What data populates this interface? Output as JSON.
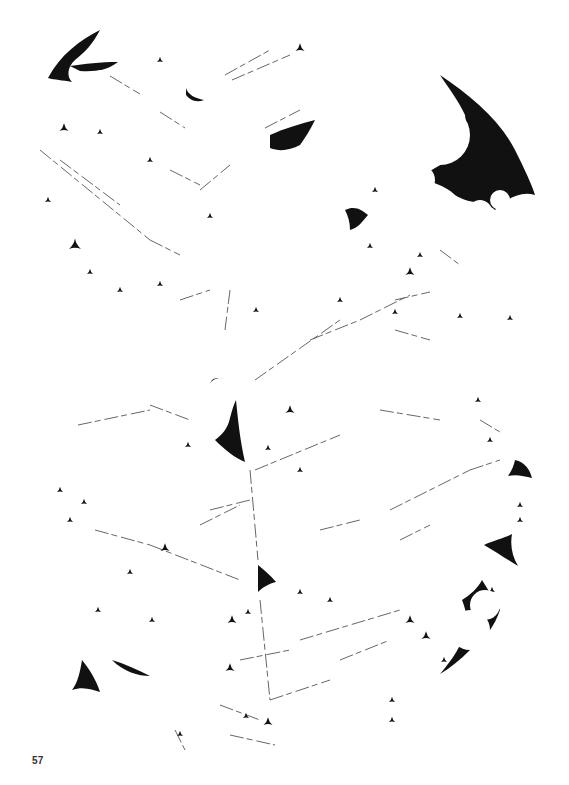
{
  "page": {
    "page_number": "57",
    "background": "#ffffff",
    "ink": "#111111",
    "line_color": "#555555"
  },
  "artwork": {
    "description": "Abstract fractal illustration of black cusp-shaped fragments (Apollonian-gasket-like gaps between white circles) and thin broken lines on a white page",
    "large_shapes": [
      "M48,78 C60,55 80,40 100,30 C92,45 85,52 75,60 C68,66 66,76 72,82 C62,80 55,80 48,78 Z",
      "M70,66 C85,64 100,62 118,62 C108,70 95,72 80,71 Z",
      "M440,75 C470,95 500,120 515,150 C525,170 532,185 535,195 C520,190 505,200 495,210 C485,200 470,205 455,195 C445,185 430,182 420,178 C430,170 440,165 450,160 C462,150 468,135 465,115 C458,100 450,90 440,75 Z",
      "M212,380 C220,375 228,380 230,390 C222,392 218,398 212,395 C210,390 208,385 212,380 Z",
      "M236,400 C238,420 240,440 245,462 C235,458 225,450 215,440 C222,435 228,428 230,418 C232,410 234,404 236,400 Z",
      "M462,600 C470,595 478,588 482,580 C488,590 495,600 500,610 C495,625 485,640 470,650 C460,660 450,668 440,674 C452,660 462,645 466,630 C468,620 466,610 462,600 Z",
      "M484,545 C495,540 505,538 512,534 C510,545 512,556 518,566 C508,560 496,552 484,545 Z",
      "M82,660 C90,670 96,680 100,692 C92,690 84,686 72,690 C78,682 80,672 82,660 Z",
      "M112,660 C125,664 138,670 150,676 C138,676 124,672 112,660 Z",
      "M270,135 C285,128 300,124 315,120 C310,130 305,138 300,145 C290,150 280,152 270,148 Z",
      "M345,210 C355,205 362,210 368,215 C362,222 358,228 350,230 C350,222 348,216 345,210 Z",
      "M258,565 C264,570 270,575 276,582 C268,584 262,588 258,592 C258,582 258,574 258,565 Z",
      "M186,88 C188,95 195,98 204,100 C196,103 190,100 186,95 Z",
      "M515,460 C525,462 530,470 532,478 C524,476 516,474 508,476 C512,470 514,465 515,460 Z"
    ],
    "small_shapes": [
      [
        64,
        128,
        3
      ],
      [
        100,
        132,
        2
      ],
      [
        75,
        245,
        4
      ],
      [
        160,
        60,
        2
      ],
      [
        300,
        48,
        3
      ],
      [
        410,
        272,
        3
      ],
      [
        420,
        255,
        2
      ],
      [
        375,
        190,
        2
      ],
      [
        150,
        160,
        2
      ],
      [
        48,
        200,
        2
      ],
      [
        90,
        272,
        2
      ],
      [
        160,
        284,
        2
      ],
      [
        120,
        290,
        2
      ],
      [
        210,
        216,
        2
      ],
      [
        256,
        310,
        2
      ],
      [
        290,
        410,
        3
      ],
      [
        300,
        470,
        2
      ],
      [
        188,
        445,
        2
      ],
      [
        268,
        448,
        2
      ],
      [
        490,
        440,
        2
      ],
      [
        478,
        400,
        2
      ],
      [
        520,
        505,
        2
      ],
      [
        60,
        490,
        2
      ],
      [
        84,
        502,
        2
      ],
      [
        70,
        520,
        2
      ],
      [
        165,
        548,
        3
      ],
      [
        130,
        572,
        2
      ],
      [
        98,
        610,
        2
      ],
      [
        152,
        620,
        2
      ],
      [
        232,
        620,
        3
      ],
      [
        248,
        612,
        2
      ],
      [
        300,
        592,
        2
      ],
      [
        330,
        600,
        2
      ],
      [
        410,
        620,
        3
      ],
      [
        426,
        636,
        3
      ],
      [
        444,
        660,
        2
      ],
      [
        230,
        668,
        3
      ],
      [
        180,
        734,
        2
      ],
      [
        268,
        722,
        3
      ],
      [
        246,
        716,
        2
      ],
      [
        392,
        700,
        2
      ],
      [
        392,
        720,
        2
      ],
      [
        492,
        590,
        2
      ],
      [
        520,
        520,
        2
      ],
      [
        395,
        312,
        2
      ],
      [
        370,
        246,
        2
      ],
      [
        340,
        300,
        2
      ],
      [
        460,
        316,
        2
      ],
      [
        510,
        318,
        2
      ]
    ],
    "lines": [
      [
        160,
        112,
        185,
        128
      ],
      [
        110,
        76,
        140,
        94
      ],
      [
        40,
        150,
        150,
        240
      ],
      [
        60,
        160,
        120,
        205
      ],
      [
        150,
        240,
        180,
        255
      ],
      [
        225,
        75,
        270,
        50
      ],
      [
        232,
        80,
        290,
        55
      ],
      [
        170,
        170,
        200,
        185
      ],
      [
        265,
        128,
        300,
        110
      ],
      [
        200,
        190,
        230,
        165
      ],
      [
        230,
        290,
        225,
        330
      ],
      [
        255,
        380,
        340,
        320
      ],
      [
        310,
        340,
        360,
        320
      ],
      [
        360,
        320,
        410,
        295
      ],
      [
        395,
        300,
        430,
        292
      ],
      [
        380,
        410,
        440,
        420
      ],
      [
        78,
        425,
        150,
        410
      ],
      [
        150,
        405,
        190,
        420
      ],
      [
        255,
        470,
        340,
        435
      ],
      [
        210,
        510,
        250,
        500
      ],
      [
        250,
        470,
        258,
        560
      ],
      [
        200,
        525,
        240,
        505
      ],
      [
        95,
        530,
        150,
        545
      ],
      [
        150,
        545,
        240,
        580
      ],
      [
        320,
        530,
        360,
        520
      ],
      [
        390,
        510,
        470,
        470
      ],
      [
        470,
        470,
        500,
        460
      ],
      [
        260,
        600,
        270,
        700
      ],
      [
        300,
        640,
        400,
        610
      ],
      [
        240,
        660,
        290,
        650
      ],
      [
        270,
        700,
        330,
        680
      ],
      [
        220,
        705,
        260,
        720
      ],
      [
        230,
        735,
        275,
        745
      ],
      [
        175,
        730,
        185,
        750
      ],
      [
        340,
        660,
        390,
        640
      ],
      [
        400,
        540,
        430,
        525
      ],
      [
        440,
        250,
        460,
        265
      ],
      [
        395,
        330,
        430,
        340
      ],
      [
        480,
        420,
        500,
        432
      ],
      [
        180,
        300,
        210,
        290
      ]
    ],
    "circles_outline": [
      [
        440,
        135,
        30
      ],
      [
        420,
        180,
        15
      ],
      [
        480,
        212,
        12
      ],
      [
        500,
        200,
        10
      ],
      [
        220,
        390,
        12
      ],
      [
        470,
        630,
        20
      ],
      [
        485,
        605,
        15
      ]
    ]
  }
}
